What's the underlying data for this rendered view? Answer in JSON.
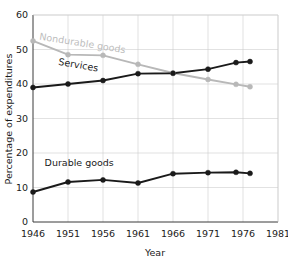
{
  "chart_data": {
    "type": "line",
    "title": "",
    "xlabel": "Year",
    "ylabel": "Percentage of expenditures",
    "xlim": [
      1946,
      1981
    ],
    "ylim": [
      0,
      60
    ],
    "xticks": [
      1946,
      1951,
      1956,
      1961,
      1966,
      1971,
      1976,
      1981
    ],
    "yticks": [
      0,
      10,
      20,
      30,
      40,
      50,
      60
    ],
    "xtick_labels": [
      "1946",
      "1951",
      "1956",
      "1961",
      "1966",
      "1971",
      "1976",
      "1981"
    ],
    "ytick_labels": [
      "0",
      "10",
      "20",
      "30",
      "40",
      "50",
      "60"
    ],
    "grid": true,
    "legend_position": "inline-labels",
    "series": [
      {
        "name": "Nondurable goods",
        "color": "#b8b8b8",
        "label_color": "#bdbdbd",
        "x": [
          1946,
          1951,
          1956,
          1961,
          1966,
          1971,
          1975,
          1977
        ],
        "values": [
          52.5,
          48.5,
          48.3,
          45.7,
          43.2,
          41.3,
          39.9,
          39.2
        ]
      },
      {
        "name": "Services",
        "color": "#1a1a1a",
        "label_color": "#1a1a1a",
        "x": [
          1946,
          1951,
          1956,
          1961,
          1966,
          1971,
          1975,
          1977
        ],
        "values": [
          39.0,
          40.0,
          41.0,
          43.0,
          43.1,
          44.3,
          46.2,
          46.5
        ]
      },
      {
        "name": "Durable goods",
        "color": "#1a1a1a",
        "label_color": "#1a1a1a",
        "x": [
          1946,
          1951,
          1956,
          1961,
          1966,
          1971,
          1975,
          1977
        ],
        "values": [
          8.7,
          11.6,
          12.2,
          11.3,
          14.0,
          14.3,
          14.4,
          14.1
        ]
      }
    ],
    "annotations": [
      {
        "text": "Nondurable goods",
        "x": 1953.0,
        "y": 50.9,
        "rotation": 9,
        "color": "#bdbdbd"
      },
      {
        "text": "Services",
        "x": 1952.4,
        "y": 44.6,
        "rotation": 10,
        "color": "#1a1a1a"
      },
      {
        "text": "Durable goods",
        "x": 1952.6,
        "y": 16.2,
        "rotation": 0,
        "color": "#1a1a1a"
      }
    ]
  }
}
